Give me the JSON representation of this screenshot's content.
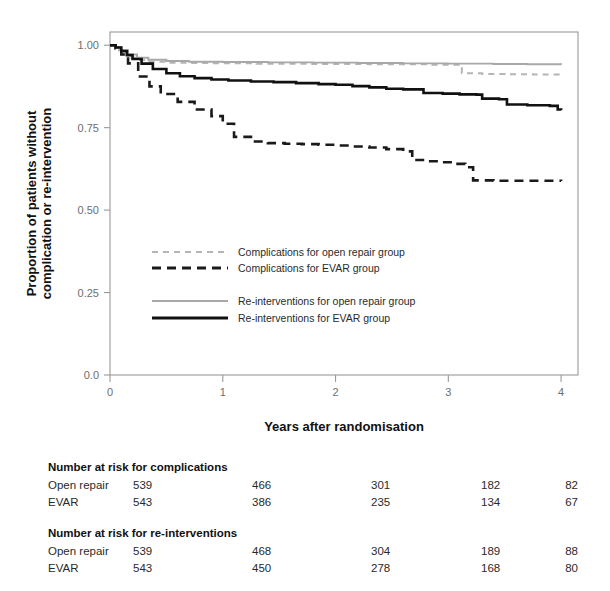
{
  "chart_data": {
    "type": "line",
    "title": "",
    "xlabel": "Years after randomisation",
    "ylabel": "Proportion of patients without complication or re-intervention",
    "ylabel_line1": "Proportion of patients without",
    "ylabel_line2": "complication or re-intervention",
    "xlim": [
      0,
      4.15
    ],
    "ylim": [
      0.0,
      1.04
    ],
    "xticks": [
      0,
      1,
      2,
      3,
      4
    ],
    "xtick_labels": [
      "0",
      "1",
      "2",
      "3",
      "4"
    ],
    "yticks": [
      0.0,
      0.25,
      0.5,
      0.75,
      1.0
    ],
    "ytick_labels": [
      "0.0",
      "0.25",
      "0.50",
      "0.75",
      "1.00"
    ],
    "grid": false,
    "legend_position": "center",
    "series": [
      {
        "name": "Complications for open repair group",
        "key": "complications_open_repair",
        "color": "#b5b5b5",
        "dash": "6,5",
        "width": 2.0,
        "x": [
          0,
          0.04,
          0.08,
          0.12,
          0.18,
          0.25,
          0.35,
          0.5,
          0.7,
          0.9,
          1.1,
          1.3,
          1.5,
          1.75,
          2.0,
          2.3,
          2.6,
          2.85,
          3.05,
          3.12,
          3.3,
          3.5,
          3.75,
          4.0
        ],
        "y": [
          1.0,
          0.995,
          0.985,
          0.972,
          0.962,
          0.955,
          0.95,
          0.947,
          0.946,
          0.945,
          0.945,
          0.944,
          0.944,
          0.943,
          0.943,
          0.942,
          0.942,
          0.941,
          0.941,
          0.915,
          0.913,
          0.912,
          0.911,
          0.91
        ]
      },
      {
        "name": "Complications for EVAR group",
        "key": "complications_evar",
        "color": "#1a1a1a",
        "dash": "9,6",
        "width": 2.6,
        "x": [
          0,
          0.05,
          0.1,
          0.16,
          0.25,
          0.35,
          0.45,
          0.6,
          0.75,
          0.9,
          1.0,
          1.1,
          1.25,
          1.4,
          1.55,
          1.7,
          1.85,
          2.0,
          2.15,
          2.3,
          2.45,
          2.6,
          2.68,
          2.8,
          2.95,
          3.05,
          3.15,
          3.22,
          3.4,
          3.6,
          3.8,
          4.0
        ],
        "y": [
          1.0,
          0.99,
          0.972,
          0.945,
          0.905,
          0.875,
          0.852,
          0.828,
          0.805,
          0.785,
          0.762,
          0.722,
          0.708,
          0.703,
          0.701,
          0.7,
          0.698,
          0.696,
          0.693,
          0.69,
          0.685,
          0.678,
          0.652,
          0.648,
          0.645,
          0.64,
          0.63,
          0.59,
          0.589,
          0.589,
          0.589,
          0.588
        ]
      },
      {
        "name": "Re-interventions for open repair group",
        "key": "reinterventions_open_repair",
        "color": "#a8a8a8",
        "dash": "",
        "width": 1.9,
        "x": [
          0,
          0.05,
          0.1,
          0.16,
          0.24,
          0.34,
          0.5,
          0.7,
          1.0,
          1.4,
          1.8,
          2.2,
          2.6,
          3.0,
          3.4,
          3.7,
          4.0
        ],
        "y": [
          1.0,
          0.995,
          0.985,
          0.972,
          0.962,
          0.956,
          0.952,
          0.95,
          0.949,
          0.948,
          0.947,
          0.946,
          0.945,
          0.944,
          0.943,
          0.942,
          0.941
        ]
      },
      {
        "name": "Re-interventions for EVAR group",
        "key": "reinterventions_evar",
        "color": "#111111",
        "dash": "",
        "width": 2.6,
        "x": [
          0,
          0.05,
          0.1,
          0.15,
          0.2,
          0.28,
          0.38,
          0.5,
          0.62,
          0.75,
          0.9,
          1.05,
          1.25,
          1.45,
          1.65,
          1.85,
          2.0,
          2.15,
          2.3,
          2.45,
          2.6,
          2.72,
          2.78,
          2.95,
          3.1,
          3.25,
          3.3,
          3.45,
          3.52,
          3.7,
          3.9,
          3.97,
          4.0
        ],
        "y": [
          1.0,
          0.993,
          0.982,
          0.97,
          0.958,
          0.944,
          0.928,
          0.915,
          0.906,
          0.9,
          0.896,
          0.893,
          0.89,
          0.888,
          0.885,
          0.882,
          0.88,
          0.876,
          0.872,
          0.868,
          0.866,
          0.866,
          0.855,
          0.853,
          0.851,
          0.85,
          0.838,
          0.836,
          0.82,
          0.818,
          0.816,
          0.805,
          0.803
        ]
      }
    ],
    "legend": [
      {
        "label": "Complications for open repair group",
        "color": "#b5b5b5",
        "dash": "6,5",
        "width": 2.0
      },
      {
        "label": "Complications for EVAR group",
        "color": "#1a1a1a",
        "dash": "9,6",
        "width": 2.8
      },
      {
        "label": "Re-interventions for open repair group",
        "color": "#a8a8a8",
        "dash": "",
        "width": 1.9
      },
      {
        "label": "Re-interventions for EVAR group",
        "color": "#111111",
        "dash": "",
        "width": 2.8
      }
    ],
    "risk_tables": [
      {
        "header": "Number at risk for complications",
        "rows": [
          {
            "label": "Open repair",
            "values": [
              "539",
              "466",
              "301",
              "182",
              "82"
            ]
          },
          {
            "label": "EVAR",
            "values": [
              "543",
              "386",
              "235",
              "134",
              "67"
            ]
          }
        ]
      },
      {
        "header": "Number at risk for re-interventions",
        "rows": [
          {
            "label": "Open repair",
            "values": [
              "539",
              "468",
              "304",
              "189",
              "88"
            ]
          },
          {
            "label": "EVAR",
            "values": [
              "543",
              "450",
              "278",
              "168",
              "80"
            ]
          }
        ]
      }
    ]
  }
}
